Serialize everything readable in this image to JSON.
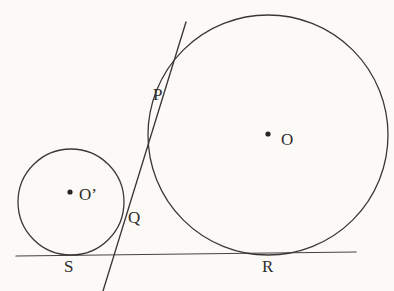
{
  "figure": {
    "type": "geometry-diagram",
    "canvas": {
      "width": 394,
      "height": 291
    },
    "background_color": "#fbfaf7",
    "stroke_color": "#3a3835",
    "label_color": "#2f2d2b",
    "stroke_width": 1.2
  },
  "shapes": {
    "large_circle": {
      "name": "circle-O",
      "center_label": "O",
      "cx": 268,
      "cy": 135,
      "r": 120
    },
    "small_circle": {
      "name": "circle-O-prime",
      "center_label": "O’",
      "cx": 71,
      "cy": 202,
      "r": 53
    },
    "base_line": {
      "name": "common-tangent-base-line",
      "x1": 16,
      "y1": 256,
      "x2": 356,
      "y2": 252
    },
    "tangent_line": {
      "name": "common-internal-tangent-line",
      "x1": 186,
      "y1": 22,
      "x2": 103,
      "y2": 291
    }
  },
  "points": [
    {
      "id": "P",
      "label": "P",
      "role": "tangency-on-large-circle",
      "dot": false,
      "label_x": 153,
      "label_y": 86
    },
    {
      "id": "Q",
      "label": "Q",
      "role": "tangency-on-small-circle",
      "dot": false,
      "label_x": 128,
      "label_y": 209
    },
    {
      "id": "S",
      "label": "S",
      "role": "tangency-small-circle-with-base-line",
      "dot": false,
      "label_x": 64,
      "label_y": 258
    },
    {
      "id": "R",
      "label": "R",
      "role": "tangency-large-circle-with-base-line",
      "dot": false,
      "label_x": 262,
      "label_y": 258
    },
    {
      "id": "O",
      "label": "O",
      "role": "center-large-circle",
      "dot": true,
      "dot_x": 268,
      "dot_y": 134,
      "label_x": 281,
      "label_y": 131
    },
    {
      "id": "Oprime",
      "label": "O’",
      "role": "center-small-circle",
      "dot": true,
      "dot_x": 70,
      "dot_y": 192,
      "label_x": 79,
      "label_y": 186
    }
  ]
}
